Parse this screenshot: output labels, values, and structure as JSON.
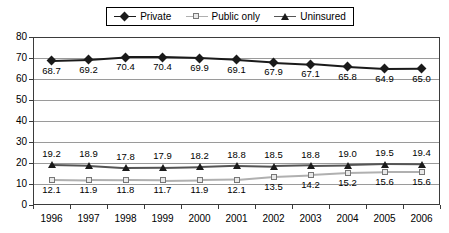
{
  "chart_data": {
    "type": "line",
    "title": "",
    "xlabel": "",
    "ylabel": "",
    "ylim": [
      0,
      80
    ],
    "ytick_step": 10,
    "yticks": [
      "0",
      "10",
      "20",
      "30",
      "40",
      "50",
      "60",
      "70",
      "80"
    ],
    "grid": true,
    "legend_position": "top-center",
    "categories": [
      "1996",
      "1997",
      "1998",
      "1999",
      "2000",
      "2001",
      "2002",
      "2003",
      "2004",
      "2005",
      "2006"
    ],
    "series": [
      {
        "name": "Private",
        "marker": "filled-diamond",
        "color": "#1a1a1a",
        "label_position": "below",
        "values": [
          68.7,
          69.2,
          70.4,
          70.4,
          69.9,
          69.1,
          67.9,
          67.1,
          65.8,
          64.9,
          65.0
        ],
        "labels": [
          "68.7",
          "69.2",
          "70.4",
          "70.4",
          "69.9",
          "69.1",
          "67.9",
          "67.1",
          "65.8",
          "64.9",
          "65.0"
        ]
      },
      {
        "name": "Public only",
        "marker": "open-square",
        "color": "#b0b0b0",
        "label_position": "below",
        "values": [
          12.1,
          11.9,
          11.8,
          11.7,
          11.9,
          12.1,
          13.5,
          14.2,
          15.2,
          15.6,
          15.6
        ],
        "labels": [
          "12.1",
          "11.9",
          "11.8",
          "11.7",
          "11.9",
          "12.1",
          "13.5",
          "14.2",
          "15.2",
          "15.6",
          "15.6"
        ]
      },
      {
        "name": "Uninsured",
        "marker": "filled-triangle",
        "color": "#555555",
        "label_position": "above",
        "values": [
          19.2,
          18.9,
          17.8,
          17.9,
          18.2,
          18.8,
          18.5,
          18.8,
          19.0,
          19.5,
          19.4
        ],
        "labels": [
          "19.2",
          "18.9",
          "17.8",
          "17.9",
          "18.2",
          "18.8",
          "18.5",
          "18.8",
          "19.0",
          "19.5",
          "19.4"
        ]
      }
    ]
  },
  "legend": {
    "entries": [
      {
        "label": "Private"
      },
      {
        "label": "Public only"
      },
      {
        "label": "Uninsured"
      }
    ]
  }
}
